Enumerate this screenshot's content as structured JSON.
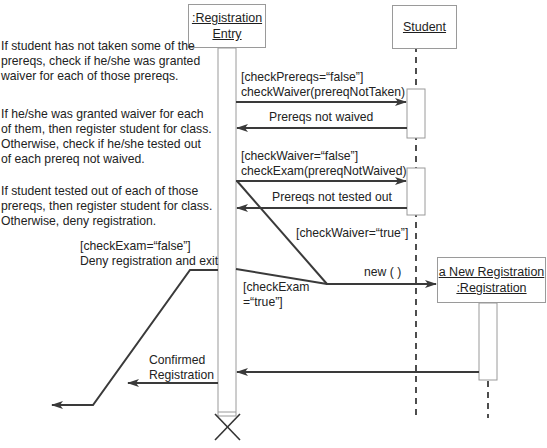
{
  "diagram": {
    "type": "UML sequence diagram",
    "objects": [
      {
        "id": "registration_entry",
        "name": ":Registration\nEntry"
      },
      {
        "id": "student",
        "name": "Student"
      },
      {
        "id": "new_registration",
        "name": "a New Registration\n:Registration"
      }
    ],
    "notes": [
      "If student has not taken some of the\nprereqs, check if he/she was granted\nwaiver for each of those prereqs.",
      "If he/she was granted waiver for each\nof them, then register student for class.\nOtherwise, check if he/she tested out\nof each prereq not waived.",
      "If student tested out of each of those\nprereqs, then register student for class.\nOtherwise, deny registration."
    ],
    "messages": {
      "check_waiver": "[checkPrereqs=“false”]\ncheckWaiver(prereqNotTaken)",
      "prereqs_not_waived": "Prereqs not waived",
      "check_exam": "[checkWaiver=“false”]\ncheckExam(prereqNotWaived)",
      "prereqs_not_tested_out": "Prereqs not tested out",
      "check_waiver_true": "[checkWaiver=“true”]",
      "new": "new ( )",
      "check_exam_true": "[checkExam\n=“true”]",
      "deny": "[checkExam=“false”]\nDeny registration and exit",
      "confirmed": "Confirmed\nRegistration"
    },
    "colors": {
      "line": "#3a3a3a",
      "box_border": "#9a9a9a",
      "text": "#222222"
    }
  }
}
